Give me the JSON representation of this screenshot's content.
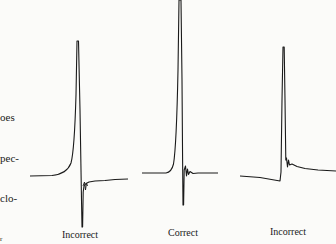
{
  "side_text_fragments": [
    "oes",
    "pec-",
    "clo-",
    "r"
  ],
  "figure": {
    "panels": [
      {
        "id": "left",
        "label": "Incorrect"
      },
      {
        "id": "middle",
        "label": "Correct"
      },
      {
        "id": "right",
        "label": "Incorrect"
      }
    ]
  },
  "colors": {
    "background": "#fbfbf9",
    "trace": "#1a1a1a"
  }
}
